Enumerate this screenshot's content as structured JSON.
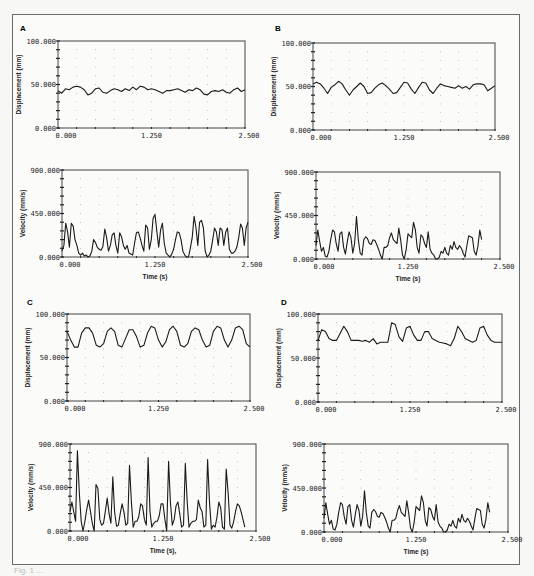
{
  "figure": {
    "caption": "Fig. 1 ...",
    "panel_letters": [
      "A",
      "B",
      "C",
      "D"
    ]
  },
  "chart_data": [
    {
      "panel": "A",
      "type": "line",
      "title": "",
      "xlabel": "",
      "ylabel": "Displacement (mm)",
      "xlim": [
        0,
        2.5
      ],
      "ylim": [
        0,
        100
      ],
      "xticks": [
        "0.000",
        "1.250",
        "2.500"
      ],
      "yticks": [
        "0.000",
        "50.000",
        "100.000"
      ],
      "grid": "dotted",
      "x": [
        0,
        0.05,
        0.1,
        0.15,
        0.2,
        0.25,
        0.3,
        0.35,
        0.4,
        0.45,
        0.5,
        0.55,
        0.6,
        0.65,
        0.7,
        0.75,
        0.8,
        0.85,
        0.9,
        0.95,
        1.0,
        1.05,
        1.1,
        1.15,
        1.2,
        1.25,
        1.3,
        1.35,
        1.4,
        1.45,
        1.5,
        1.55,
        1.6,
        1.65,
        1.7,
        1.75,
        1.8,
        1.85,
        1.9,
        1.95,
        2.0,
        2.05,
        2.1,
        2.15,
        2.2,
        2.25,
        2.3,
        2.35,
        2.4,
        2.45,
        2.5
      ],
      "values": [
        43,
        40,
        45,
        44,
        47,
        48,
        47,
        44,
        38,
        40,
        45,
        46,
        41,
        40,
        43,
        45,
        44,
        42,
        45,
        43,
        47,
        44,
        48,
        47,
        44,
        45,
        44,
        42,
        40,
        43,
        43,
        44,
        45,
        43,
        41,
        44,
        43,
        46,
        44,
        39,
        38,
        42,
        43,
        42,
        44,
        41,
        40,
        44,
        46,
        42,
        44
      ]
    },
    {
      "panel": "A",
      "type": "line",
      "title": "",
      "xlabel": "Time (s)",
      "ylabel": "Velocity (mm/s)",
      "xlim": [
        0,
        2.5
      ],
      "ylim": [
        0,
        900
      ],
      "xticks": [
        "0.000",
        "1.250",
        "2.500"
      ],
      "yticks": [
        "0.000",
        "450.000",
        "900.000"
      ],
      "grid": "dotted",
      "x": [
        0,
        0.025,
        0.05,
        0.075,
        0.1,
        0.125,
        0.15,
        0.175,
        0.2,
        0.225,
        0.25,
        0.275,
        0.3,
        0.325,
        0.35,
        0.375,
        0.4,
        0.425,
        0.45,
        0.475,
        0.5,
        0.525,
        0.55,
        0.575,
        0.6,
        0.625,
        0.65,
        0.675,
        0.7,
        0.725,
        0.75,
        0.775,
        0.8,
        0.825,
        0.85,
        0.875,
        0.9,
        0.925,
        0.95,
        0.975,
        1.0,
        1.025,
        1.05,
        1.075,
        1.1,
        1.125,
        1.15,
        1.175,
        1.2,
        1.225,
        1.25,
        1.275,
        1.3,
        1.325,
        1.35,
        1.375,
        1.4,
        1.425,
        1.45,
        1.475,
        1.5,
        1.525,
        1.55,
        1.575,
        1.6,
        1.625,
        1.65,
        1.675,
        1.7,
        1.725,
        1.75,
        1.775,
        1.8,
        1.825,
        1.85,
        1.875,
        1.9,
        1.925,
        1.95,
        1.975,
        2.0,
        2.025,
        2.05,
        2.075,
        2.1,
        2.125,
        2.15,
        2.175,
        2.2,
        2.225,
        2.25,
        2.275,
        2.3,
        2.325,
        2.35,
        2.375,
        2.4,
        2.425,
        2.45,
        2.475,
        2.5
      ],
      "values": [
        60,
        120,
        350,
        260,
        100,
        350,
        320,
        180,
        120,
        40,
        20,
        40,
        10,
        20,
        0,
        10,
        60,
        180,
        150,
        100,
        80,
        70,
        110,
        290,
        200,
        60,
        120,
        230,
        250,
        120,
        40,
        250,
        210,
        120,
        80,
        120,
        40,
        30,
        20,
        140,
        250,
        260,
        200,
        120,
        60,
        330,
        300,
        80,
        180,
        400,
        440,
        260,
        100,
        280,
        350,
        140,
        40,
        20,
        0,
        30,
        80,
        180,
        260,
        250,
        180,
        60,
        20,
        0,
        0,
        90,
        200,
        420,
        310,
        120,
        360,
        380,
        300,
        60,
        0,
        20,
        60,
        180,
        300,
        260,
        120,
        300,
        280,
        120,
        260,
        300,
        80,
        40,
        40,
        60,
        100,
        200,
        340,
        300,
        120,
        300,
        360
      ]
    },
    {
      "panel": "B",
      "type": "line",
      "title": "",
      "xlabel": "",
      "ylabel": "Displacement (mm)",
      "xlim": [
        0,
        2.5
      ],
      "ylim": [
        0,
        100
      ],
      "xticks": [
        "0.000",
        "1.250",
        "2.500"
      ],
      "yticks": [
        "0.000",
        "50.000",
        "100.000"
      ],
      "grid": "dotted",
      "x": [
        0,
        0.05,
        0.1,
        0.15,
        0.2,
        0.25,
        0.3,
        0.35,
        0.4,
        0.45,
        0.5,
        0.55,
        0.6,
        0.65,
        0.7,
        0.75,
        0.8,
        0.85,
        0.9,
        0.95,
        1.0,
        1.05,
        1.1,
        1.15,
        1.2,
        1.25,
        1.3,
        1.35,
        1.4,
        1.45,
        1.5,
        1.55,
        1.6,
        1.65,
        1.7,
        1.75,
        1.8,
        1.85,
        1.9,
        1.95,
        2.0,
        2.05,
        2.1,
        2.15,
        2.2,
        2.25,
        2.3,
        2.35,
        2.4,
        2.45,
        2.5
      ],
      "values": [
        53,
        55,
        53,
        48,
        42,
        49,
        52,
        56,
        53,
        46,
        40,
        46,
        50,
        54,
        50,
        42,
        43,
        48,
        52,
        54,
        51,
        47,
        42,
        43,
        49,
        55,
        54,
        47,
        42,
        49,
        55,
        54,
        46,
        42,
        48,
        53,
        51,
        50,
        49,
        48,
        51,
        48,
        50,
        47,
        52,
        53,
        53,
        52,
        45,
        48,
        51
      ]
    },
    {
      "panel": "B",
      "type": "line",
      "title": "",
      "xlabel": "Time (s)",
      "ylabel": "Velocity (mm/s)",
      "xlim": [
        0,
        2.5
      ],
      "ylim": [
        0,
        900
      ],
      "xticks": [
        "0.000",
        "1.250",
        "2.500"
      ],
      "yticks": [
        "0.000",
        "450.000",
        "900.000"
      ],
      "grid": "dotted",
      "x": [
        0,
        0.025,
        0.05,
        0.075,
        0.1,
        0.125,
        0.15,
        0.175,
        0.2,
        0.225,
        0.25,
        0.275,
        0.3,
        0.325,
        0.35,
        0.375,
        0.4,
        0.425,
        0.45,
        0.475,
        0.5,
        0.525,
        0.55,
        0.575,
        0.6,
        0.625,
        0.65,
        0.675,
        0.7,
        0.725,
        0.75,
        0.775,
        0.8,
        0.825,
        0.85,
        0.875,
        0.9,
        0.925,
        0.95,
        0.975,
        1.0,
        1.025,
        1.05,
        1.075,
        1.1,
        1.125,
        1.15,
        1.175,
        1.2,
        1.225,
        1.25,
        1.275,
        1.3,
        1.325,
        1.35,
        1.375,
        1.4,
        1.425,
        1.45,
        1.475,
        1.5,
        1.525,
        1.55,
        1.575,
        1.6,
        1.625,
        1.65,
        1.675,
        1.7,
        1.725,
        1.75,
        1.775,
        1.8,
        1.825,
        1.85,
        1.875,
        1.9,
        1.925,
        1.95,
        1.975,
        2.0,
        2.025,
        2.05,
        2.075,
        2.1,
        2.125,
        2.15,
        2.175,
        2.2,
        2.225,
        2.25,
        2.275,
        2.3,
        2.325,
        2.35,
        2.375,
        2.4,
        2.425,
        2.45,
        2.475,
        2.5
      ],
      "values": [
        140,
        300,
        180,
        80,
        120,
        30,
        20,
        80,
        200,
        300,
        280,
        160,
        80,
        260,
        280,
        120,
        50,
        180,
        280,
        220,
        60,
        160,
        440,
        200,
        60,
        40,
        200,
        230,
        210,
        160,
        150,
        200,
        190,
        150,
        100,
        40,
        0,
        120,
        120,
        140,
        220,
        270,
        200,
        180,
        160,
        320,
        200,
        40,
        0,
        100,
        260,
        240,
        220,
        380,
        300,
        120,
        60,
        250,
        230,
        160,
        120,
        280,
        100,
        60,
        40,
        0,
        0,
        20,
        80,
        60,
        120,
        60,
        40,
        140,
        100,
        180,
        120,
        100,
        140,
        110,
        60,
        20,
        140,
        240,
        230,
        220,
        80,
        40,
        130,
        300,
        200
      ]
    },
    {
      "panel": "C",
      "type": "line",
      "title": "",
      "xlabel": "",
      "ylabel": "Displacement (mm)",
      "xlim": [
        0,
        2.5
      ],
      "ylim": [
        0,
        100
      ],
      "xticks": [
        "0.000",
        "1.250",
        "2.500"
      ],
      "yticks": [
        "0.000",
        "50.000",
        "100.000"
      ],
      "grid": "dotted",
      "x": [
        0,
        0.05,
        0.1,
        0.15,
        0.2,
        0.25,
        0.3,
        0.35,
        0.4,
        0.45,
        0.5,
        0.55,
        0.6,
        0.65,
        0.7,
        0.75,
        0.8,
        0.85,
        0.9,
        0.95,
        1.0,
        1.05,
        1.1,
        1.15,
        1.2,
        1.25,
        1.3,
        1.35,
        1.4,
        1.45,
        1.5,
        1.55,
        1.6,
        1.65,
        1.7,
        1.75,
        1.8,
        1.85,
        1.9,
        1.95,
        2.0,
        2.05,
        2.1,
        2.15,
        2.2,
        2.25,
        2.3,
        2.35,
        2.4,
        2.45,
        2.5
      ],
      "values": [
        80,
        70,
        62,
        62,
        78,
        84,
        84,
        78,
        64,
        62,
        66,
        80,
        84,
        80,
        64,
        62,
        72,
        82,
        82,
        74,
        62,
        64,
        78,
        86,
        84,
        70,
        62,
        68,
        82,
        86,
        80,
        64,
        62,
        66,
        80,
        84,
        82,
        70,
        62,
        64,
        80,
        86,
        84,
        70,
        62,
        70,
        84,
        86,
        82,
        66,
        62
      ]
    },
    {
      "panel": "C",
      "type": "line",
      "title": "",
      "xlabel": "Time (s),",
      "ylabel": "Velocity (mm/s)",
      "xlim": [
        0,
        2.5
      ],
      "ylim": [
        0,
        900
      ],
      "xticks": [
        "0.000",
        "1.250",
        "2.500"
      ],
      "yticks": [
        "0.000",
        "450.000",
        "900.000"
      ],
      "grid": "dotted",
      "x": [
        0,
        0.025,
        0.05,
        0.075,
        0.1,
        0.125,
        0.15,
        0.175,
        0.2,
        0.225,
        0.25,
        0.275,
        0.3,
        0.325,
        0.35,
        0.375,
        0.4,
        0.425,
        0.45,
        0.475,
        0.5,
        0.525,
        0.55,
        0.575,
        0.6,
        0.625,
        0.65,
        0.675,
        0.7,
        0.725,
        0.75,
        0.775,
        0.8,
        0.825,
        0.85,
        0.875,
        0.9,
        0.925,
        0.95,
        0.975,
        1.0,
        1.025,
        1.05,
        1.075,
        1.1,
        1.125,
        1.15,
        1.175,
        1.2,
        1.225,
        1.25,
        1.275,
        1.3,
        1.325,
        1.35,
        1.375,
        1.4,
        1.425,
        1.45,
        1.475,
        1.5,
        1.525,
        1.55,
        1.575,
        1.6,
        1.625,
        1.65,
        1.675,
        1.7,
        1.725,
        1.75,
        1.775,
        1.8,
        1.825,
        1.85,
        1.875,
        1.9,
        1.925,
        1.95,
        1.975,
        2.0,
        2.025,
        2.05,
        2.075,
        2.1,
        2.125,
        2.15,
        2.175,
        2.2,
        2.225,
        2.25,
        2.275,
        2.3,
        2.325,
        2.35,
        2.375,
        2.4,
        2.425,
        2.45,
        2.475,
        2.5
      ],
      "values": [
        200,
        300,
        200,
        100,
        830,
        400,
        100,
        0,
        100,
        220,
        320,
        200,
        80,
        0,
        480,
        440,
        120,
        60,
        80,
        200,
        340,
        180,
        80,
        560,
        200,
        50,
        60,
        180,
        280,
        200,
        60,
        80,
        680,
        300,
        40,
        100,
        100,
        150,
        280,
        260,
        120,
        60,
        760,
        200,
        40,
        80,
        100,
        100,
        160,
        280,
        280,
        120,
        0,
        720,
        300,
        60,
        120,
        260,
        300,
        180,
        40,
        60,
        700,
        300,
        40,
        80,
        100,
        100,
        120,
        320,
        240,
        200,
        40,
        60,
        740,
        300,
        20,
        60,
        40,
        140,
        300,
        240,
        40,
        20,
        640,
        400,
        60,
        30,
        100,
        200,
        280,
        260,
        200,
        120,
        40
      ]
    },
    {
      "panel": "D",
      "type": "line",
      "title": "",
      "xlabel": "",
      "ylabel": "Displacement (mm)",
      "xlim": [
        0,
        2.5
      ],
      "ylim": [
        0,
        100
      ],
      "xticks": [
        "0.000",
        "1.250",
        "2.500"
      ],
      "yticks": [
        "0.000",
        "50.000",
        "100.000"
      ],
      "grid": "dotted",
      "x": [
        0,
        0.05,
        0.1,
        0.15,
        0.2,
        0.25,
        0.3,
        0.35,
        0.4,
        0.45,
        0.5,
        0.55,
        0.6,
        0.65,
        0.7,
        0.75,
        0.8,
        0.85,
        0.9,
        0.95,
        1.0,
        1.05,
        1.1,
        1.15,
        1.2,
        1.25,
        1.3,
        1.35,
        1.4,
        1.45,
        1.5,
        1.55,
        1.6,
        1.65,
        1.7,
        1.75,
        1.8,
        1.85,
        1.9,
        1.95,
        2.0,
        2.05,
        2.1,
        2.15,
        2.2,
        2.25,
        2.3,
        2.35,
        2.4,
        2.45,
        2.5
      ],
      "values": [
        70,
        82,
        80,
        72,
        70,
        70,
        78,
        86,
        80,
        70,
        70,
        70,
        69,
        70,
        68,
        72,
        66,
        68,
        68,
        68,
        90,
        88,
        74,
        69,
        84,
        86,
        76,
        70,
        70,
        80,
        80,
        72,
        70,
        68,
        67,
        66,
        64,
        72,
        86,
        80,
        72,
        70,
        68,
        70,
        84,
        86,
        76,
        70,
        68,
        68,
        68
      ]
    },
    {
      "panel": "D",
      "type": "line",
      "title": "",
      "xlabel": "Time (s)",
      "ylabel": "Velocity (mm/s)",
      "xlim": [
        0,
        2.5
      ],
      "ylim": [
        0,
        900
      ],
      "xticks": [
        "0.000",
        "1.250",
        "2.500"
      ],
      "yticks": [
        "0.000",
        "450.000",
        "900.000"
      ],
      "grid": "dotted",
      "x": [
        0,
        0.025,
        0.05,
        0.075,
        0.1,
        0.125,
        0.15,
        0.175,
        0.2,
        0.225,
        0.25,
        0.275,
        0.3,
        0.325,
        0.35,
        0.375,
        0.4,
        0.425,
        0.45,
        0.475,
        0.5,
        0.525,
        0.55,
        0.575,
        0.6,
        0.625,
        0.65,
        0.675,
        0.7,
        0.725,
        0.75,
        0.775,
        0.8,
        0.825,
        0.85,
        0.875,
        0.9,
        0.925,
        0.95,
        0.975,
        1.0,
        1.025,
        1.05,
        1.075,
        1.1,
        1.125,
        1.15,
        1.175,
        1.2,
        1.225,
        1.25,
        1.275,
        1.3,
        1.325,
        1.35,
        1.375,
        1.4,
        1.425,
        1.45,
        1.475,
        1.5,
        1.525,
        1.55,
        1.575,
        1.6,
        1.625,
        1.65,
        1.675,
        1.7,
        1.725,
        1.75,
        1.775,
        1.8,
        1.825,
        1.85,
        1.875,
        1.9,
        1.925,
        1.95,
        1.975,
        2.0,
        2.025,
        2.05,
        2.075,
        2.1,
        2.125,
        2.15,
        2.175,
        2.2,
        2.225,
        2.25,
        2.275,
        2.3,
        2.325,
        2.35,
        2.375,
        2.4,
        2.425,
        2.45,
        2.475,
        2.5
      ],
      "values": [
        140,
        300,
        180,
        80,
        120,
        30,
        20,
        80,
        200,
        300,
        280,
        160,
        80,
        260,
        280,
        120,
        50,
        180,
        280,
        220,
        60,
        160,
        420,
        200,
        60,
        40,
        200,
        230,
        210,
        160,
        150,
        200,
        190,
        150,
        100,
        40,
        0,
        120,
        120,
        140,
        220,
        270,
        200,
        180,
        160,
        320,
        200,
        40,
        0,
        100,
        260,
        240,
        220,
        370,
        300,
        120,
        60,
        250,
        230,
        160,
        120,
        280,
        100,
        60,
        40,
        0,
        0,
        20,
        80,
        60,
        120,
        60,
        40,
        140,
        100,
        180,
        120,
        100,
        140,
        110,
        60,
        20,
        140,
        240,
        230,
        220,
        80,
        40,
        130,
        300,
        200
      ]
    }
  ]
}
